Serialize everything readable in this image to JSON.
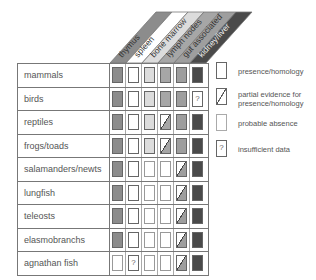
{
  "columns": [
    {
      "label": "thymus",
      "color": "#8c8c8c"
    },
    {
      "label": "spleen",
      "color": "#ffffff"
    },
    {
      "label": "bone marrow",
      "color": "#dcdcdc"
    },
    {
      "label": "lymph nodes",
      "color": "#a6a6a6"
    },
    {
      "label": "gut associated",
      "color": "#9e9e9e"
    },
    {
      "label": "kidney/liver",
      "color": "#4a4a4a"
    }
  ],
  "rows": [
    {
      "label": "mammals",
      "cells": [
        "P",
        "P",
        "P",
        "P",
        "P",
        "P"
      ]
    },
    {
      "label": "birds",
      "cells": [
        "P",
        "P",
        "P",
        "P",
        "P",
        "?"
      ]
    },
    {
      "label": "reptiles",
      "cells": [
        "P",
        "P",
        "P",
        "/",
        "P",
        "P"
      ]
    },
    {
      "label": "frogs/toads",
      "cells": [
        "P",
        "P",
        "P",
        "/",
        "P",
        "P"
      ]
    },
    {
      "label": "salamanders/newts",
      "cells": [
        "P",
        "P",
        "A",
        "A",
        "/",
        "P"
      ]
    },
    {
      "label": "lungfish",
      "cells": [
        "P",
        "P",
        "A",
        "A",
        "/",
        "P"
      ]
    },
    {
      "label": "teleosts",
      "cells": [
        "P",
        "P",
        "A",
        "A",
        "/",
        "P"
      ]
    },
    {
      "label": "elasmobranchs",
      "cells": [
        "P",
        "P",
        "A",
        "A",
        "/",
        "P"
      ]
    },
    {
      "label": "agnathan fish",
      "cells": [
        "A",
        "?",
        "A",
        "A",
        "/",
        "P"
      ]
    }
  ],
  "legend": {
    "presence": "presence/homology",
    "partial": "partial evidence for presence/homology",
    "absence": "probable absence",
    "insufficient": "insufficient data",
    "question_mark": "?"
  }
}
